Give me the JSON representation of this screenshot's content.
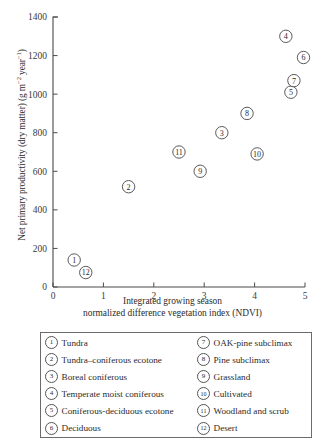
{
  "chart_data": {
    "type": "scatter",
    "title": "",
    "xlabel": "Integrated growing season normalized difference vegetation index (NDVI)",
    "xlabel_lines": [
      "Integrated growing season",
      "normalized difference vegetation index (NDVI)"
    ],
    "ylabel": "Net primary productivity (dry matter) (g m−2 year−1)",
    "ylabel_parts": {
      "main": "Net primary productivity (dry matter) (g m",
      "sup1": "−2",
      "mid": " year",
      "sup2": "−1",
      "tail": ")"
    },
    "xlim": [
      0,
      5
    ],
    "ylim": [
      0,
      1400
    ],
    "xticks": [
      0,
      1,
      2,
      3,
      4,
      5
    ],
    "yticks": [
      0,
      200,
      400,
      600,
      800,
      1000,
      1200,
      1400
    ],
    "xtick_labels": [
      "0",
      "1",
      "2",
      "3",
      "4",
      "5"
    ],
    "ytick_labels": [
      "0",
      "200",
      "400",
      "600",
      "800",
      "1000",
      "1200",
      "1400"
    ],
    "grid": false,
    "legend_position": "below-plot",
    "marker": "numbered-circle",
    "points": [
      {
        "id": "1",
        "label": "Tundra",
        "x": 0.42,
        "y": 140
      },
      {
        "id": "2",
        "label": "Tundra–coniferous ecotone",
        "x": 1.5,
        "y": 520
      },
      {
        "id": "3",
        "label": "Boreal coniferous",
        "x": 3.35,
        "y": 800
      },
      {
        "id": "4",
        "label": "Temperate moist coniferous",
        "x": 4.62,
        "y": 1300
      },
      {
        "id": "5",
        "label": "Coniferous-deciduous ecotone",
        "x": 4.72,
        "y": 1010
      },
      {
        "id": "6",
        "label": "Deciduous",
        "x": 4.97,
        "y": 1190
      },
      {
        "id": "7",
        "label": "OAK-pine subclimax",
        "x": 4.78,
        "y": 1070
      },
      {
        "id": "8",
        "label": "Pine subclimax",
        "x": 3.85,
        "y": 900
      },
      {
        "id": "9",
        "label": "Grassland",
        "x": 2.92,
        "y": 600
      },
      {
        "id": "10",
        "label": "Cultivated",
        "x": 4.05,
        "y": 690
      },
      {
        "id": "11",
        "label": "Woodland and scrub",
        "x": 2.5,
        "y": 700
      },
      {
        "id": "12",
        "label": "Desert",
        "x": 0.65,
        "y": 75
      }
    ]
  },
  "legend": {
    "column_left": [
      {
        "num": "1",
        "label": "Tundra"
      },
      {
        "num": "2",
        "label": "Tundra–coniferous ecotone"
      },
      {
        "num": "3",
        "label": "Boreal coniferous"
      },
      {
        "num": "4",
        "label": "Temperate moist coniferous"
      },
      {
        "num": "5",
        "label": "Coniferous-deciduous ecotone"
      },
      {
        "num": "6",
        "label": "Deciduous"
      }
    ],
    "column_right": [
      {
        "num": "7",
        "label": "OAK-pine subclimax"
      },
      {
        "num": "8",
        "label": "Pine subclimax"
      },
      {
        "num": "9",
        "label": "Grassland"
      },
      {
        "num": "10",
        "label": "Cultivated"
      },
      {
        "num": "11",
        "label": "Woodland and scrub"
      },
      {
        "num": "12",
        "label": "Desert"
      }
    ]
  },
  "colors": {
    "background": "#ffffff",
    "axis": "#4a4a4a",
    "text": "#2b2b2b",
    "marker_stroke": "#515151",
    "legend_border": "#6b6b6b"
  }
}
